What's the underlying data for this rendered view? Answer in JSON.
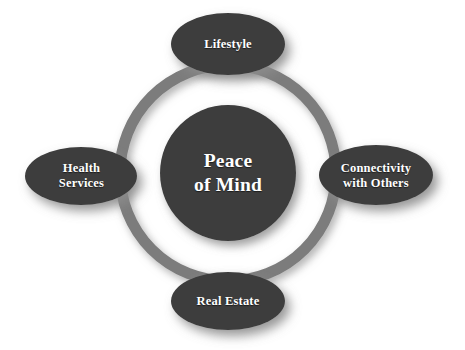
{
  "diagram": {
    "type": "hub-and-spoke-circle",
    "background_color": "#ffffff",
    "node_fill_color": "#3d3d3d",
    "ring_color": "#7b7b7b",
    "label_color": "#ffffff",
    "shadow_color": "#9a9a9a",
    "center": {
      "label": "Peace\nof Mind",
      "line1": "Peace",
      "line2": "of Mind",
      "shape": "circle",
      "cx": 228,
      "cy": 173,
      "r": 68
    },
    "ring": {
      "cx": 228,
      "cy": 173,
      "r": 108,
      "stroke_width": 11
    },
    "nodes": [
      {
        "id": "lifestyle",
        "label": "Lifestyle",
        "shape": "ellipse",
        "position": "top",
        "cx": 228,
        "cy": 44,
        "rx": 57,
        "ry": 31
      },
      {
        "id": "connectivity-with-others",
        "label": "Connectivity\nwith Others",
        "line1": "Connectivity",
        "line2": "with Others",
        "shape": "ellipse",
        "position": "right",
        "cx": 376,
        "cy": 175,
        "rx": 57,
        "ry": 30
      },
      {
        "id": "real-estate",
        "label": "Real Estate",
        "shape": "ellipse",
        "position": "bottom",
        "cx": 228,
        "cy": 301,
        "rx": 57,
        "ry": 29
      },
      {
        "id": "health-services",
        "label": "Health\nServices",
        "line1": "Health",
        "line2": "Services",
        "shape": "ellipse",
        "position": "left",
        "cx": 81,
        "cy": 176,
        "rx": 56,
        "ry": 29
      }
    ]
  }
}
